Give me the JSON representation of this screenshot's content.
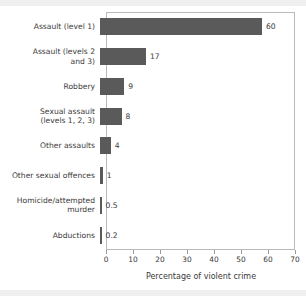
{
  "chart_data": {
    "type": "bar",
    "orientation": "horizontal",
    "title": "",
    "subtitle": "",
    "xlabel": "Percentage of violent crime",
    "ylabel": "",
    "xlim": [
      0,
      70
    ],
    "xticks": [
      0,
      10,
      20,
      30,
      40,
      50,
      60,
      70
    ],
    "xtick_labels": [
      "0",
      "10",
      "20",
      "30",
      "40",
      "50",
      "60",
      "70"
    ],
    "grid": false,
    "legend": null,
    "bar_color": "#5a5a5a",
    "frame_color": "#b9b9b9",
    "categories": [
      "Assault (level 1)",
      "Assault (levels 2\nand 3)",
      "Robbery",
      "Sexual assault\n(levels 1, 2, 3)",
      "Other assaults",
      "Other sexual offences",
      "Homicide/attempted\nmurder",
      "Abductions"
    ],
    "values": [
      60,
      17,
      9,
      8,
      4,
      1,
      0.5,
      0.2
    ],
    "value_labels": [
      "60",
      "17",
      "9",
      "8",
      "4",
      "1",
      "0.5",
      "0.2"
    ],
    "bars": [
      {
        "label": "Assault (level 1)",
        "value": 60,
        "value_label": "60"
      },
      {
        "label": "Assault (levels 2\nand 3)",
        "value": 17,
        "value_label": "17"
      },
      {
        "label": "Robbery",
        "value": 9,
        "value_label": "9"
      },
      {
        "label": "Sexual assault\n(levels 1, 2, 3)",
        "value": 8,
        "value_label": "8"
      },
      {
        "label": "Other assaults",
        "value": 4,
        "value_label": "4"
      },
      {
        "label": "Other sexual offences",
        "value": 1,
        "value_label": "1"
      },
      {
        "label": "Homicide/attempted\nmurder",
        "value": 0.5,
        "value_label": "0.5"
      },
      {
        "label": "Abductions",
        "value": 0.2,
        "value_label": "0.2"
      }
    ]
  }
}
